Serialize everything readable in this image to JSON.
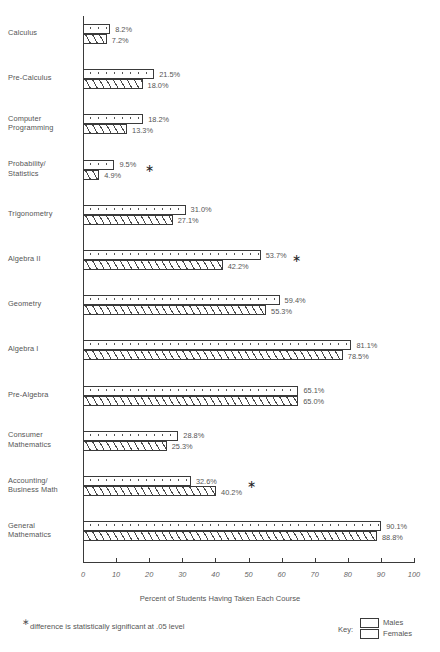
{
  "chart_data": {
    "type": "bar",
    "orientation": "horizontal",
    "title": "",
    "xlabel": "Percent of Students Having Taken Each Course",
    "ylabel": "",
    "xlim": [
      0,
      100
    ],
    "grid": false,
    "tick_labels": [
      "0",
      "10",
      "20",
      "30",
      "40",
      "50",
      "60",
      "70",
      "80",
      "90",
      "100"
    ],
    "categories": [
      "Calculus",
      "Pre-Calculus",
      "Computer Programming",
      "Probability/ Statistics",
      "Trigonometry",
      "Algebra II",
      "Geometry",
      "Algebra I",
      "Pre-Algebra",
      "Consumer Mathematics",
      "Accounting/ Business Math",
      "General Mathematics"
    ],
    "series": [
      {
        "name": "Males",
        "values": [
          8.2,
          21.5,
          18.2,
          9.5,
          31.0,
          53.7,
          59.4,
          81.1,
          65.1,
          28.8,
          32.6,
          90.1
        ],
        "labels": [
          "8.2%",
          "21.5%",
          "18.2%",
          "9.5%",
          "31.0%",
          "53.7%",
          "59.4%",
          "81.1%",
          "65.1%",
          "28.8%",
          "32.6%",
          "90.1%"
        ],
        "pattern": "dotted"
      },
      {
        "name": "Females",
        "values": [
          7.2,
          18.0,
          13.3,
          4.9,
          27.1,
          42.2,
          55.3,
          78.5,
          65.0,
          25.3,
          40.2,
          88.8
        ],
        "labels": [
          "7.2%",
          "18.0%",
          "13.3%",
          "4.9%",
          "27.1%",
          "55.3%",
          "55.3%",
          "78.5%",
          "65.0%",
          "25.3%",
          "40.2%",
          "88.8%"
        ],
        "pattern": "diagonal-hatch"
      }
    ],
    "female_labels": [
      "7.2%",
      "18.0%",
      "13.3%",
      "4.9%",
      "27.1%",
      "42.2%",
      "55.3%",
      "78.5%",
      "65.0%",
      "25.3%",
      "40.2%",
      "88.8%"
    ],
    "significance_marks": [
      false,
      false,
      false,
      true,
      false,
      true,
      false,
      false,
      false,
      false,
      true,
      false
    ],
    "significance_symbol": "∗"
  },
  "rows": [
    {
      "label_line1": "Calculus",
      "label_line2": "",
      "male": "8.2%",
      "female": "7.2%",
      "star": ""
    },
    {
      "label_line1": "Pre-Calculus",
      "label_line2": "",
      "male": "21.5%",
      "female": "18.0%",
      "star": ""
    },
    {
      "label_line1": "Computer",
      "label_line2": "Programming",
      "male": "18.2%",
      "female": "13.3%",
      "star": ""
    },
    {
      "label_line1": "Probability/",
      "label_line2": "Statistics",
      "male": "9.5%",
      "female": "4.9%",
      "star": "∗"
    },
    {
      "label_line1": "Trigonometry",
      "label_line2": "",
      "male": "31.0%",
      "female": "27.1%",
      "star": ""
    },
    {
      "label_line1": "Algebra II",
      "label_line2": "",
      "male": "53.7%",
      "female": "42.2%",
      "star": "∗"
    },
    {
      "label_line1": "Geometry",
      "label_line2": "",
      "male": "59.4%",
      "female": "55.3%",
      "star": ""
    },
    {
      "label_line1": "Algebra I",
      "label_line2": "",
      "male": "81.1%",
      "female": "78.5%",
      "star": ""
    },
    {
      "label_line1": "Pre-Algebra",
      "label_line2": "",
      "male": "65.1%",
      "female": "65.0%",
      "star": ""
    },
    {
      "label_line1": "Consumer",
      "label_line2": "Mathematics",
      "male": "28.8%",
      "female": "25.3%",
      "star": ""
    },
    {
      "label_line1": "Accounting/",
      "label_line2": "Business Math",
      "male": "32.6%",
      "female": "40.2%",
      "star": "∗"
    },
    {
      "label_line1": "General",
      "label_line2": "Mathematics",
      "male": "90.1%",
      "female": "88.8%",
      "star": ""
    }
  ],
  "axis": {
    "title": "Percent of Students Having Taken Each Course",
    "ticks": [
      "0",
      "10",
      "20",
      "30",
      "40",
      "50",
      "60",
      "70",
      "80",
      "90",
      "100"
    ]
  },
  "footnote": {
    "star": "∗",
    "text": "difference is statistically significant at .05 level"
  },
  "legend": {
    "title": "Key:",
    "males": "Males",
    "females": "Females"
  }
}
